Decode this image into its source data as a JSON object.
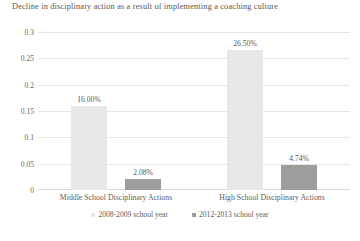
{
  "chart_data": {
    "type": "bar",
    "title": "Decline in disciplinary action as a result of implementing a coaching culture",
    "xlabel": "",
    "ylabel": "",
    "ylim": [
      0,
      0.3
    ],
    "yticks": [
      "0",
      "0.05",
      "0.1",
      "0.15",
      "0.2",
      "0.25",
      "0.3"
    ],
    "ytick_values": [
      0,
      0.05,
      0.1,
      0.15,
      0.2,
      0.25,
      0.3
    ],
    "grid": true,
    "legend_position": "bottom",
    "categories": [
      "Middle School Disciplinary Actions",
      "High School Disciplinary Actions"
    ],
    "series": [
      {
        "name": "2008-2009 school year",
        "color": "#e8e8e6",
        "values": [
          0.16,
          0.265
        ],
        "labels": [
          "16.00%",
          "26.50%"
        ]
      },
      {
        "name": "2012-2013 school year",
        "color": "#9d9d9c",
        "values": [
          0.0208,
          0.0474
        ],
        "labels": [
          "2.08%",
          "4.74%"
        ]
      }
    ]
  }
}
